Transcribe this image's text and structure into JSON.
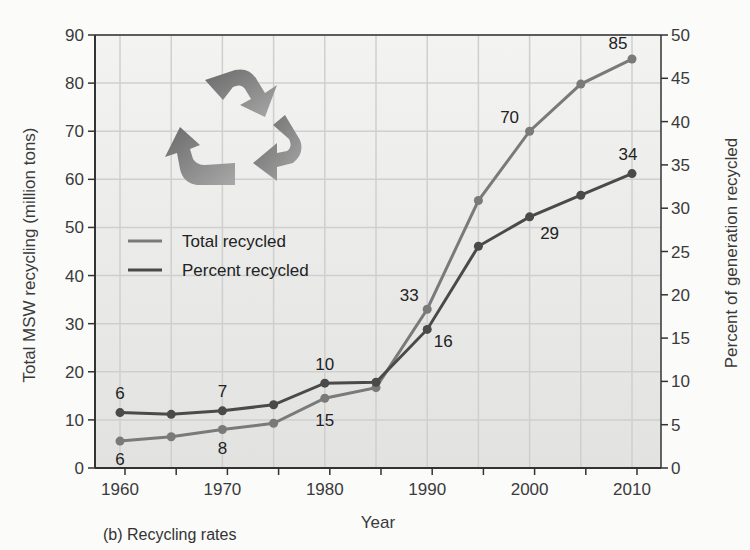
{
  "caption": "(b) Recycling rates",
  "colors": {
    "total_line": "#7a7a7a",
    "percent_line": "#4a4a4a",
    "plot_bg": "#e9e9e8",
    "grid": "#cfcfcf",
    "axis": "#333333"
  },
  "legend": {
    "items": [
      {
        "label": "Total recycled",
        "color": "#7a7a7a"
      },
      {
        "label": "Percent recycled",
        "color": "#4a4a4a"
      }
    ]
  },
  "decoration": {
    "icon": "recycle-icon"
  },
  "chart_data": {
    "type": "line",
    "title": "",
    "subtitle": "(b) Recycling rates",
    "xlabel": "Year",
    "ylabel": "Total MSW recycling (million tons)",
    "y2label": "Percent of generation recycled",
    "x": [
      1960,
      1965,
      1970,
      1975,
      1980,
      1985,
      1990,
      1995,
      2000,
      2005,
      2010
    ],
    "x_ticks": [
      1960,
      1970,
      1980,
      1990,
      2000,
      2010
    ],
    "xlim": [
      1957.5,
      2012.5
    ],
    "ylim": [
      0,
      90
    ],
    "y_ticks": [
      0,
      10,
      20,
      30,
      40,
      50,
      60,
      70,
      80,
      90
    ],
    "y2lim": [
      0,
      50
    ],
    "y2_ticks": [
      0,
      5,
      10,
      15,
      20,
      25,
      30,
      35,
      40,
      45,
      50
    ],
    "grid": true,
    "legend_position": "upper-left (inside plot, below recycle icon)",
    "series": [
      {
        "name": "Total recycled",
        "axis": "left",
        "values": [
          5.6,
          6.5,
          8.0,
          9.3,
          14.5,
          16.7,
          33.0,
          55.6,
          70.0,
          79.8,
          85.0
        ],
        "annotations": [
          {
            "x": 1960,
            "text": "6"
          },
          {
            "x": 1970,
            "text": "8"
          },
          {
            "x": 1980,
            "text": "15"
          },
          {
            "x": 1990,
            "text": "33"
          },
          {
            "x": 2000,
            "text": "70"
          },
          {
            "x": 2010,
            "text": "85"
          }
        ]
      },
      {
        "name": "Percent recycled",
        "axis": "right",
        "values": [
          6.4,
          6.2,
          6.6,
          7.3,
          9.8,
          9.9,
          16.0,
          25.6,
          29.0,
          31.5,
          34.0
        ],
        "annotations": [
          {
            "x": 1960,
            "text": "6"
          },
          {
            "x": 1970,
            "text": "7"
          },
          {
            "x": 1980,
            "text": "10"
          },
          {
            "x": 1990,
            "text": "16"
          },
          {
            "x": 2000,
            "text": "29"
          },
          {
            "x": 2010,
            "text": "34"
          }
        ]
      }
    ]
  }
}
